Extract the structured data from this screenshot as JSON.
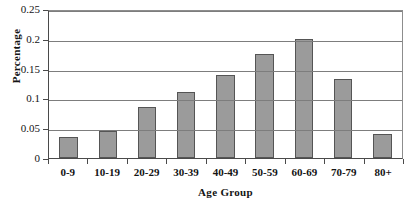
{
  "chart_data": {
    "type": "bar",
    "title": "",
    "xlabel": "Age Group",
    "ylabel": "Percentage",
    "categories": [
      "0-9",
      "10-19",
      "20-29",
      "30-39",
      "40-49",
      "50-59",
      "60-69",
      "70-79",
      "80+"
    ],
    "values": [
      0.036,
      0.045,
      0.085,
      0.111,
      0.14,
      0.175,
      0.2,
      0.133,
      0.041
    ],
    "ylim": [
      0,
      0.25
    ],
    "yticks": [
      0,
      0.05,
      0.1,
      0.15,
      0.2,
      0.25
    ],
    "ytick_labels": [
      "0",
      "0.05",
      "0.1",
      "0.15",
      "0.2",
      "0.25"
    ],
    "grid": true,
    "legend": false,
    "bar_color": "#9b9b9b",
    "bar_border_color": "#555555",
    "axis_color": "#4a4a4a",
    "gridline_color": "#7d7d7d"
  }
}
